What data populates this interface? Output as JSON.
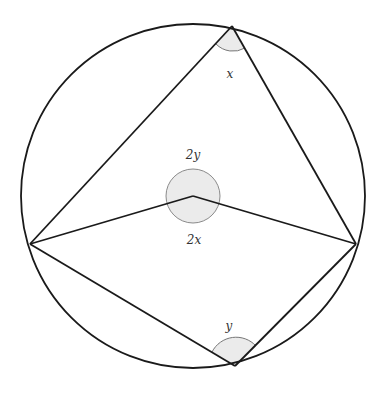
{
  "diagram": {
    "type": "circle-geometry",
    "colors": {
      "stroke": "#1a1a1a",
      "angle_fill": "#ebebeb",
      "angle_stroke": "#777777",
      "background": "#ffffff"
    },
    "circle": {
      "cx": 193,
      "cy": 196,
      "r": 172
    },
    "points": {
      "top": [
        232,
        26
      ],
      "left": [
        30,
        244
      ],
      "right": [
        356,
        244
      ],
      "bottom": [
        235,
        366
      ],
      "center": [
        193,
        196
      ]
    },
    "labels": {
      "top_angle": "x",
      "bottom_angle": "y",
      "center_reflex": "2y",
      "center_angle": "2x"
    }
  }
}
